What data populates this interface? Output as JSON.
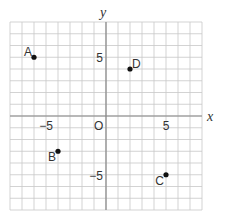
{
  "chart_data": {
    "type": "scatter",
    "title": "",
    "xlabel": "x",
    "ylabel": "y",
    "xlim": [
      -8,
      8
    ],
    "ylim": [
      -8,
      8
    ],
    "grid": true,
    "x_ticks": [
      {
        "value": -5,
        "label": "−5"
      },
      {
        "value": 5,
        "label": "5"
      }
    ],
    "y_ticks": [
      {
        "value": 5,
        "label": "5"
      },
      {
        "value": -5,
        "label": "−5"
      }
    ],
    "origin_label": "O",
    "points": [
      {
        "label": "A",
        "x": -6,
        "y": 5
      },
      {
        "label": "D",
        "x": 2,
        "y": 4
      },
      {
        "label": "B",
        "x": -4,
        "y": -3
      },
      {
        "label": "C",
        "x": 5,
        "y": -5
      }
    ]
  },
  "colors": {
    "grid": "#c8c8c8",
    "axis": "#888888",
    "point": "#111111",
    "text": "#333333"
  }
}
